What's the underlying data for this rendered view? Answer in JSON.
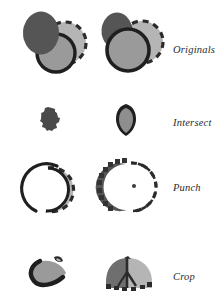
{
  "figure": {
    "title_visible": false,
    "canvas": {
      "width": 221,
      "height": 307,
      "background": "#ffffff"
    },
    "colors": {
      "gear_fill": "#555555",
      "gear_fill_light": "#5c5c5c",
      "dashed_circle_fill": "#b5b5b5",
      "dashed_stroke": "#2b2b2b",
      "outlined_circle_fill": "#9a9a9a",
      "outline_stroke": "#1f1f1f",
      "intersect_blob_fill": "#4a4a4a",
      "shield_fill": "#8e8e8e",
      "label_color": "#2b2b2b"
    }
  },
  "rows": [
    {
      "label": "Originals",
      "name": "row-originals",
      "shapes": [
        {
          "name": "cog-shape",
          "fill": "#555555",
          "note": "toothed cog, dark gray"
        },
        {
          "name": "dashed-circle-shape",
          "fill": "#b5b5b5",
          "note": "light gray circle, dashed outline"
        },
        {
          "name": "outlined-circle-shape",
          "fill": "#9a9a9a",
          "note": "medium gray circle, thick dark outline"
        }
      ]
    },
    {
      "label": "Intersect",
      "name": "row-intersect",
      "shapes": [
        {
          "name": "intersect-blob-left",
          "fill": "#4a4a4a",
          "note": "small toothed overlap blob"
        },
        {
          "name": "intersect-shield-right",
          "fill": "#8e8e8e",
          "note": "shield/teardrop overlap with dark outline"
        }
      ]
    },
    {
      "label": "Punch",
      "name": "row-punch",
      "shapes": [
        {
          "name": "punch-crescent-left",
          "fill": "#b5b5b5",
          "note": "dashed crescent with outlined crescent behind"
        },
        {
          "name": "punch-crescent-right",
          "fill": "#555555",
          "note": "cog crescent plus dashed crescent, bite removed"
        }
      ]
    },
    {
      "label": "Crop",
      "name": "row-crop",
      "shapes": [
        {
          "name": "crop-lens-left",
          "fill": "#9a9a9a",
          "note": "lens / leaf sliver with thick dark outline"
        },
        {
          "name": "crop-dome-right",
          "fill": "#b5b5b5",
          "note": "dome split dark gray left / light gray right"
        }
      ]
    }
  ],
  "labels": {
    "originals": "Originals",
    "intersect": "Intersect",
    "punch": "Punch",
    "crop": "Crop"
  }
}
